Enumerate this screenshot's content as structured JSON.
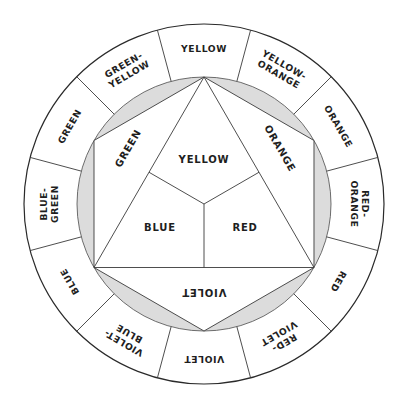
{
  "colors": {
    "line": "#3a3a3a",
    "shade": "#dcdcdc",
    "text": "#1e1e1e",
    "background": "#ffffff"
  },
  "outer_ring": {
    "segments": [
      {
        "angle": 0,
        "lines": [
          "YELLOW"
        ]
      },
      {
        "angle": 30,
        "lines": [
          "YELLOW-",
          "ORANGE"
        ]
      },
      {
        "angle": 60,
        "lines": [
          "ORANGE"
        ]
      },
      {
        "angle": 90,
        "lines": [
          "RED-",
          "ORANGE"
        ]
      },
      {
        "angle": 120,
        "lines": [
          "RED"
        ]
      },
      {
        "angle": 150,
        "lines": [
          "RED-",
          "VIOLET"
        ]
      },
      {
        "angle": 180,
        "lines": [
          "VIOLET"
        ]
      },
      {
        "angle": 210,
        "lines": [
          "VIOLET-",
          "BLUE"
        ]
      },
      {
        "angle": 240,
        "lines": [
          "BLUE"
        ]
      },
      {
        "angle": 270,
        "lines": [
          "BLUE-",
          "GREEN"
        ]
      },
      {
        "angle": 300,
        "lines": [
          "GREEN"
        ]
      },
      {
        "angle": 330,
        "lines": [
          "GREEN-",
          "YELLOW"
        ]
      }
    ]
  },
  "secondary": {
    "green": "GREEN",
    "orange": "ORANGE",
    "violet": "VIOLET"
  },
  "primary": {
    "yellow": "YELLOW",
    "blue": "BLUE",
    "red": "RED"
  }
}
